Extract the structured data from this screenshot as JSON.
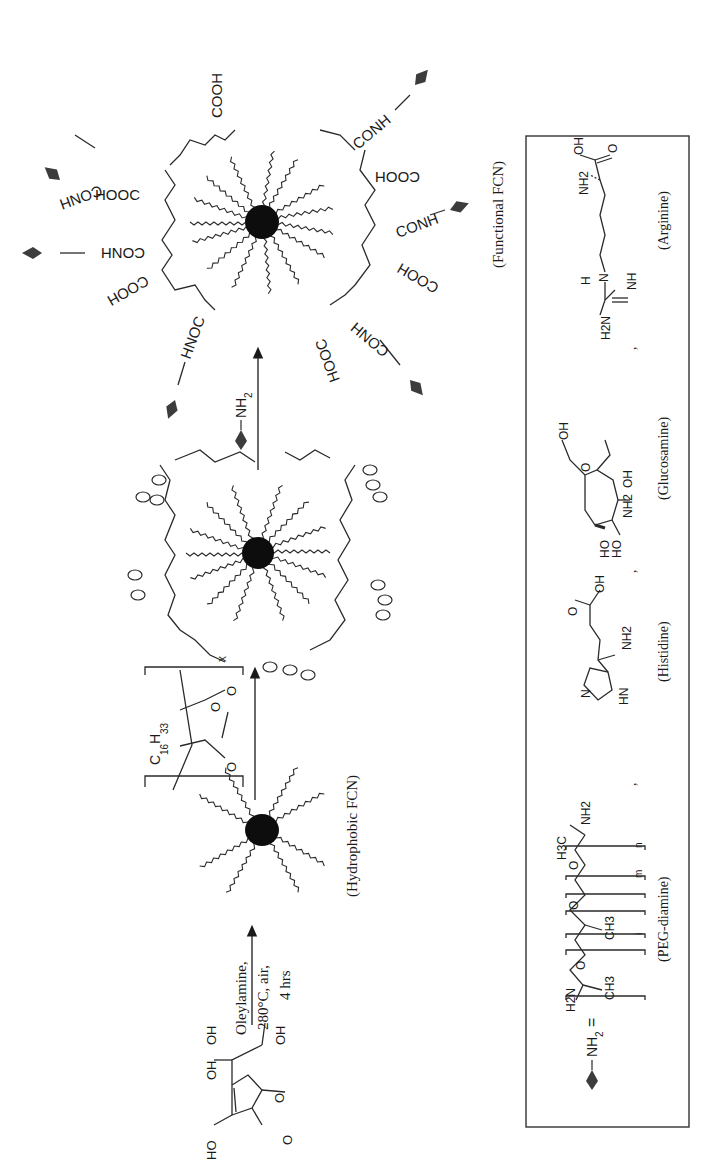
{
  "figure": {
    "orientation": "rotated-90-ccw",
    "colors": {
      "ink": "#1a1a1a",
      "core": "#0d0d0d",
      "ligand_marker": "#3c3c3c",
      "background": "#ffffff"
    }
  },
  "scheme": {
    "starting_material": {
      "name": "ascorbic acid",
      "atoms": [
        "HO",
        "OH",
        "OH",
        "OH",
        "O",
        "O"
      ]
    },
    "step1": {
      "conditions_line1": "Oleylamine,",
      "conditions_line2": "280°C, air,",
      "conditions_line3": "4 hrs"
    },
    "hydrophobic_fcn": {
      "label": "(Hydrophobic FCN)"
    },
    "step2": {
      "reagent": "C16H33 polyanhydride",
      "reagent_sub_c": "C",
      "reagent_sub_c_index": "16",
      "reagent_sub_h": "H",
      "reagent_sub_h_index": "33",
      "repeat_index": "x",
      "ring_oxygen": "O"
    },
    "step3": {
      "reagent_label": "NH",
      "reagent_index": "2"
    },
    "functional_fcn": {
      "label": "(Functional FCN)",
      "groups": [
        "COOH",
        "CONH",
        "HOOC",
        "CONH",
        "COOH",
        "HNOC",
        "CONH",
        "COOH",
        "CONH",
        "COOH",
        "CONH",
        "HOOC"
      ]
    }
  },
  "legend": {
    "equals_label": "NH",
    "equals_index": "2",
    "equals_sign": "=",
    "separator": ",",
    "ligands": [
      {
        "name": "(PEG-diamine)",
        "atoms": [
          "H2N",
          "CH3",
          "O",
          "CH3",
          "O",
          "O",
          "H3C",
          "NH2"
        ],
        "indices": [
          "i",
          "m",
          "n"
        ]
      },
      {
        "name": "(Histidine)",
        "atoms": [
          "N",
          "HN",
          "O",
          "OH",
          "NH2"
        ]
      },
      {
        "name": "(Glucosamine)",
        "atoms": [
          "OH",
          "O",
          "HO",
          "HO",
          "NH2",
          "OH"
        ]
      },
      {
        "name": "(Arginine)",
        "atoms": [
          "H2N",
          "H",
          "N",
          "NH",
          "NH2",
          "OH",
          "O"
        ]
      }
    ]
  }
}
